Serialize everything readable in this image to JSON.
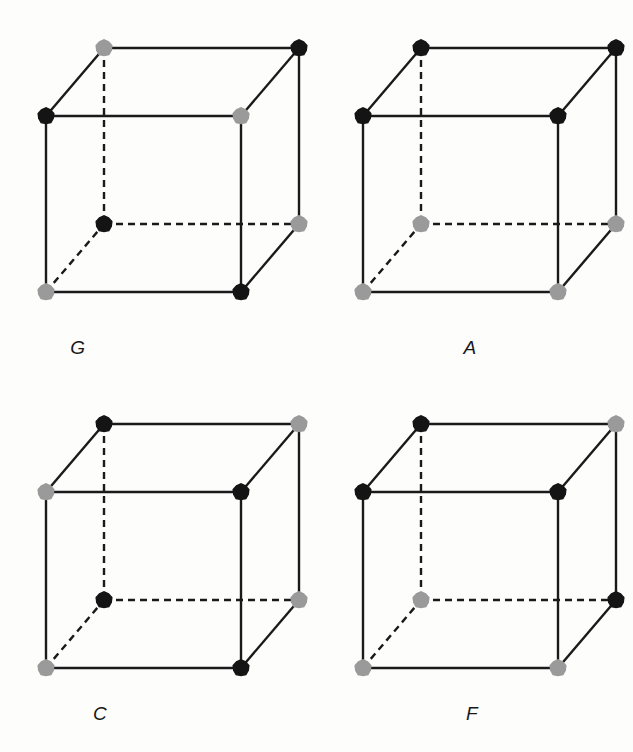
{
  "figure": {
    "background_color": "#fdfdfc",
    "edge_color": "#1a1a1a",
    "atom_black": "#141414",
    "atom_gray": "#9a9a9a",
    "atom_radius": 9,
    "edge_width": 2.4,
    "dash_pattern": "7,5",
    "geometry": {
      "front_bottom_left": [
        46,
        292
      ],
      "front_bottom_right": [
        241,
        292
      ],
      "front_top_left": [
        46,
        116
      ],
      "front_top_right": [
        241,
        116
      ],
      "depth_dx": 58,
      "depth_dy": -68
    },
    "panels": [
      {
        "id": "panel-G",
        "label": "G",
        "position": "top-left",
        "vertices": {
          "front_top_left": "black",
          "front_top_right": "gray",
          "front_bottom_left": "gray",
          "front_bottom_right": "black",
          "back_top_left": "gray",
          "back_top_right": "black",
          "back_bottom_left": "black",
          "back_bottom_right": "gray"
        }
      },
      {
        "id": "panel-A",
        "label": "A",
        "position": "top-right",
        "vertices": {
          "front_top_left": "black",
          "front_top_right": "black",
          "front_bottom_left": "gray",
          "front_bottom_right": "gray",
          "back_top_left": "black",
          "back_top_right": "black",
          "back_bottom_left": "gray",
          "back_bottom_right": "gray"
        }
      },
      {
        "id": "panel-C",
        "label": "C",
        "position": "bottom-left",
        "vertices": {
          "front_top_left": "gray",
          "front_top_right": "black",
          "front_bottom_left": "gray",
          "front_bottom_right": "black",
          "back_top_left": "black",
          "back_top_right": "gray",
          "back_bottom_left": "black",
          "back_bottom_right": "gray"
        }
      },
      {
        "id": "panel-F",
        "label": "F",
        "position": "bottom-right",
        "vertices": {
          "front_top_left": "black",
          "front_top_right": "black",
          "front_bottom_left": "gray",
          "front_bottom_right": "gray",
          "back_top_left": "black",
          "back_top_right": "gray",
          "back_bottom_left": "gray",
          "back_bottom_right": "black"
        }
      }
    ]
  }
}
